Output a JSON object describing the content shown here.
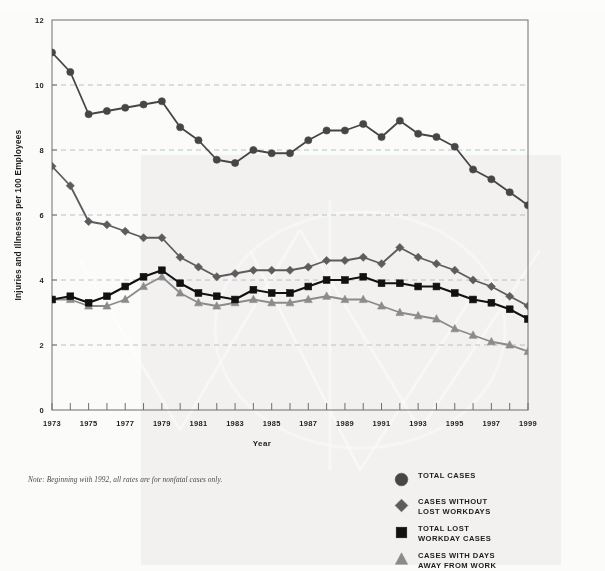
{
  "axes": {
    "ylabel": "Injuries and Illnesses per 100 Employees",
    "xlabel": "Year",
    "yticks": [
      "0",
      "2",
      "4",
      "6",
      "8",
      "10",
      "12"
    ],
    "xticks": [
      "1973",
      "1975",
      "1977",
      "1979",
      "1981",
      "1983",
      "1985",
      "1987",
      "1989",
      "1991",
      "1993",
      "1995",
      "1997",
      "1999"
    ]
  },
  "note": "Note: Beginning with 1992, all rates are for nonfatal cases only.",
  "legend": [
    {
      "label": "TOTAL CASES",
      "marker": "circle",
      "color": "#464646"
    },
    {
      "label": "CASES WITHOUT\nLOST WORKDAYS",
      "marker": "diamond",
      "color": "#5c5c5c"
    },
    {
      "label": "TOTAL LOST\nWORKDAY CASES",
      "marker": "square",
      "color": "#111111"
    },
    {
      "label": "CASES WITH DAYS\nAWAY FROM WORK",
      "marker": "triangle",
      "color": "#8b8b8b"
    }
  ],
  "chart_data": {
    "type": "line",
    "title": "",
    "xlabel": "Year",
    "ylabel": "Injuries and Illnesses per 100 Employees",
    "xlim": [
      1973,
      1999
    ],
    "ylim": [
      0,
      12
    ],
    "ytick_step": 2,
    "xtick_step": 1,
    "xtick_label_step": 2,
    "grid": "horizontal-dashed",
    "legend_position": "bottom-right",
    "x": [
      1973,
      1974,
      1975,
      1976,
      1977,
      1978,
      1979,
      1980,
      1981,
      1982,
      1983,
      1984,
      1985,
      1986,
      1987,
      1988,
      1989,
      1990,
      1991,
      1992,
      1993,
      1994,
      1995,
      1996,
      1997,
      1998,
      1999
    ],
    "series": [
      {
        "name": "TOTAL CASES",
        "marker": "circle",
        "color": "#464646",
        "values": [
          11.0,
          10.4,
          9.1,
          9.2,
          9.3,
          9.4,
          9.5,
          8.7,
          8.3,
          7.7,
          7.6,
          8.0,
          7.9,
          7.9,
          8.3,
          8.6,
          8.6,
          8.8,
          8.4,
          8.9,
          8.5,
          8.4,
          8.1,
          7.4,
          7.1,
          6.7,
          6.3
        ]
      },
      {
        "name": "CASES WITHOUT LOST WORKDAYS",
        "marker": "diamond",
        "color": "#5c5c5c",
        "values": [
          7.5,
          6.9,
          5.8,
          5.7,
          5.5,
          5.3,
          5.3,
          4.7,
          4.4,
          4.1,
          4.2,
          4.3,
          4.3,
          4.3,
          4.4,
          4.6,
          4.6,
          4.7,
          4.5,
          5.0,
          4.7,
          4.5,
          4.3,
          4.0,
          3.8,
          3.5,
          3.2
        ]
      },
      {
        "name": "TOTAL LOST WORKDAY CASES",
        "marker": "square",
        "color": "#111111",
        "values": [
          3.4,
          3.5,
          3.3,
          3.5,
          3.8,
          4.1,
          4.3,
          3.9,
          3.6,
          3.5,
          3.4,
          3.7,
          3.6,
          3.6,
          3.8,
          4.0,
          4.0,
          4.1,
          3.9,
          3.9,
          3.8,
          3.8,
          3.6,
          3.4,
          3.3,
          3.1,
          2.8
        ]
      },
      {
        "name": "CASES WITH DAYS AWAY FROM WORK",
        "marker": "triangle",
        "color": "#8b8b8b",
        "values": [
          3.4,
          3.4,
          3.2,
          3.2,
          3.4,
          3.8,
          4.1,
          3.6,
          3.3,
          3.2,
          3.3,
          3.4,
          3.3,
          3.3,
          3.4,
          3.5,
          3.4,
          3.4,
          3.2,
          3.0,
          2.9,
          2.8,
          2.5,
          2.3,
          2.1,
          2.0,
          1.8
        ]
      }
    ]
  }
}
